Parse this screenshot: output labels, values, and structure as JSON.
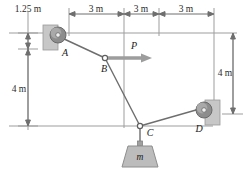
{
  "figure": {
    "colors": {
      "line": "#8a8a8a",
      "cable": "#6e6e6e",
      "text": "#1a1a1a",
      "wall_fill": "#c9c9c9",
      "pulley_fill": "#8f8f8f",
      "mass_fill": "#b9b9b9",
      "arrow": "#9a9a9a"
    },
    "dimensions": {
      "top": [
        {
          "label": "3 m",
          "value": 3,
          "unit": "m"
        },
        {
          "label": "3 m",
          "value": 3,
          "unit": "m"
        },
        {
          "label": "3 m",
          "value": 3,
          "unit": "m"
        }
      ],
      "left_top": {
        "label": "1.25 m",
        "value": 1.25,
        "unit": "m"
      },
      "left_bottom": {
        "label": "4 m",
        "value": 4,
        "unit": "m"
      },
      "right": {
        "label": "4 m",
        "value": 4,
        "unit": "m"
      }
    },
    "points": [
      {
        "id": "A",
        "label": "A",
        "kind": "pulley-wall-left"
      },
      {
        "id": "B",
        "label": "B",
        "kind": "cable-node"
      },
      {
        "id": "C",
        "label": "C",
        "kind": "cable-node"
      },
      {
        "id": "D",
        "label": "D",
        "kind": "pulley-wall-right"
      }
    ],
    "force": {
      "label": "P",
      "direction": "right",
      "applied_at": "B"
    },
    "mass": {
      "label": "m"
    }
  }
}
